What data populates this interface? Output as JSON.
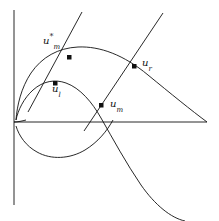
{
  "figure": {
    "width": 219,
    "height": 221,
    "background": "#ffffff",
    "stroke_color": "#111111",
    "axes": {
      "origin": {
        "x": 14,
        "y": 122
      },
      "y_axis": {
        "x": 14,
        "y_top": 10,
        "y_bottom": 205
      },
      "x_axis": {
        "y": 122,
        "x_left": 14,
        "x_right": 207
      },
      "grid": false,
      "tick_labels": []
    },
    "labels": [
      {
        "name": "u-m-star",
        "base": "u",
        "sub": "m",
        "sup": "*",
        "x": 43,
        "y": 36
      },
      {
        "name": "u-r",
        "base": "u",
        "sub": "r",
        "sup": "",
        "x": 142,
        "y": 58
      },
      {
        "name": "u-l",
        "base": "u",
        "sub": "l",
        "sup": "",
        "x": 52,
        "y": 84
      },
      {
        "name": "u-m",
        "base": "u",
        "sub": "m",
        "sup": "",
        "x": 110,
        "y": 99
      }
    ],
    "markers": [
      {
        "name": "marker-u-m-star",
        "x": 69,
        "y": 57,
        "size": 4,
        "shape": "square"
      },
      {
        "name": "marker-u-r",
        "x": 134,
        "y": 66,
        "size": 4,
        "shape": "square"
      },
      {
        "name": "marker-u-l",
        "x": 55,
        "y": 83,
        "size": 4,
        "shape": "square"
      },
      {
        "name": "marker-u-m",
        "x": 101,
        "y": 105,
        "size": 4,
        "shape": "square"
      }
    ],
    "curves": [
      {
        "name": "outer-hugoniot-curve",
        "kind": "curve",
        "path": "M 16,120 C 17,106 21,88 31,73 C 42,57 58,48 78,47 C 100,46 124,55 148,75 C 170,93 192,111 207,122"
      },
      {
        "name": "inner-hugoniot-curve",
        "kind": "curve",
        "path": "M 16,120 C 18,110 24,98 33,90 C 43,81 55,79 66,83 C 80,88 92,102 101,118 C 113,139 126,163 141,185 C 155,205 171,218 185,221"
      },
      {
        "name": "inner-lower-loop",
        "kind": "curve",
        "path": "M 16,126 C 19,136 26,146 37,152 C 51,160 70,159 85,150 C 98,142 107,131 113,120"
      },
      {
        "name": "origin-cusp-tail",
        "kind": "curve",
        "path": "M 14,122 C 18,122 22,121 26,120"
      }
    ],
    "lines": [
      {
        "name": "characteristic-line-left",
        "kind": "line",
        "x1": 82,
        "y1": 12,
        "x2": 28,
        "y2": 112
      },
      {
        "name": "characteristic-line-right",
        "kind": "line",
        "x1": 163,
        "y1": 13,
        "x2": 84,
        "y2": 131
      }
    ]
  }
}
